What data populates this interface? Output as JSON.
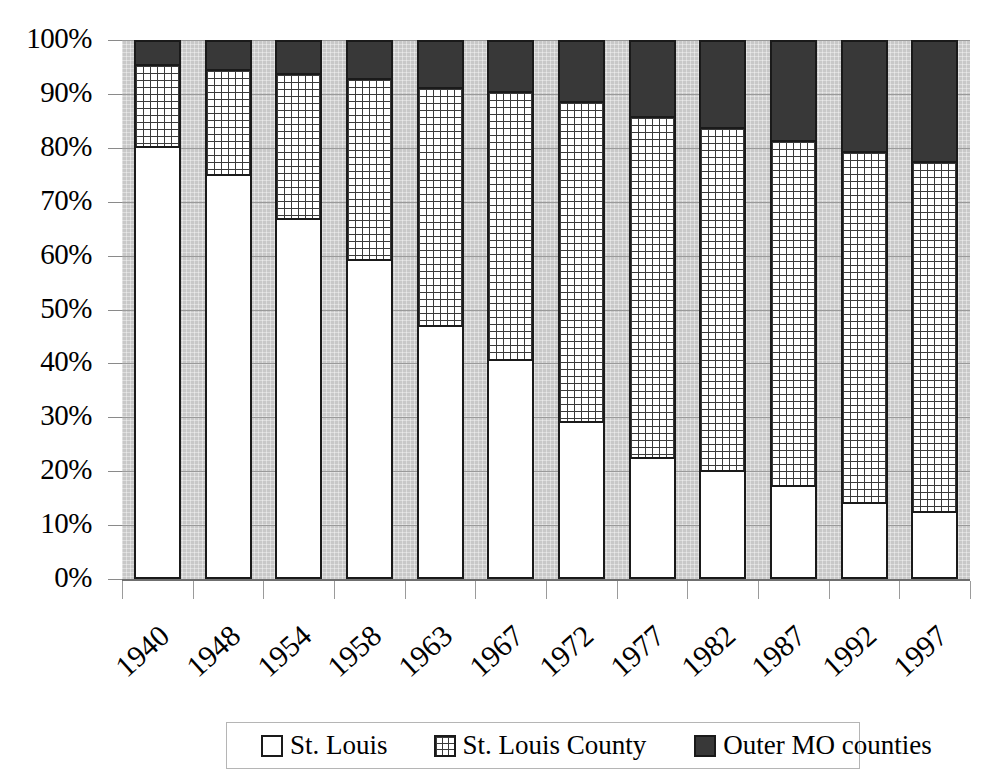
{
  "chart_data": {
    "type": "bar",
    "subtype": "stacked-100-percent",
    "title": "",
    "subtitle": "",
    "xlabel": "",
    "ylabel": "",
    "ylim": [
      0,
      100
    ],
    "yticks": [
      "0%",
      "10%",
      "20%",
      "30%",
      "40%",
      "50%",
      "60%",
      "70%",
      "80%",
      "90%",
      "100%"
    ],
    "grid": true,
    "legend_position": "bottom",
    "categories": [
      "1940",
      "1948",
      "1954",
      "1958",
      "1963",
      "1967",
      "1972",
      "1977",
      "1982",
      "1987",
      "1992",
      "1997"
    ],
    "series": [
      {
        "name": "St. Louis",
        "fill": "white",
        "values": [
          80.3,
          75.2,
          67.0,
          59.4,
          47.2,
          40.9,
          29.4,
          22.7,
          20.2,
          17.5,
          14.3,
          12.7
        ]
      },
      {
        "name": "St. Louis County",
        "fill": "grid-hatch",
        "values": [
          15.2,
          19.5,
          26.8,
          33.6,
          44.1,
          49.6,
          59.2,
          63.2,
          63.7,
          63.9,
          65.2,
          64.9
        ]
      },
      {
        "name": "Outer MO counties",
        "fill": "dark-gray",
        "values": [
          4.5,
          5.3,
          6.2,
          7.0,
          8.7,
          9.5,
          11.4,
          14.1,
          16.1,
          18.6,
          20.5,
          22.4
        ]
      }
    ]
  },
  "legend": {
    "items": [
      {
        "label": "St. Louis",
        "swatch": "white-square-icon"
      },
      {
        "label": "St. Louis County",
        "swatch": "grid-hatch-square-icon"
      },
      {
        "label": "Outer MO counties",
        "swatch": "dark-square-icon"
      }
    ]
  },
  "colors": {
    "plot_background": "#c8c8c8",
    "gridline": "#9a9a9a",
    "bar_outline": "#1a1a1a",
    "series_st_louis": "#ffffff",
    "series_st_louis_county": "#ffffff",
    "series_outer_mo_counties": "#383838"
  }
}
